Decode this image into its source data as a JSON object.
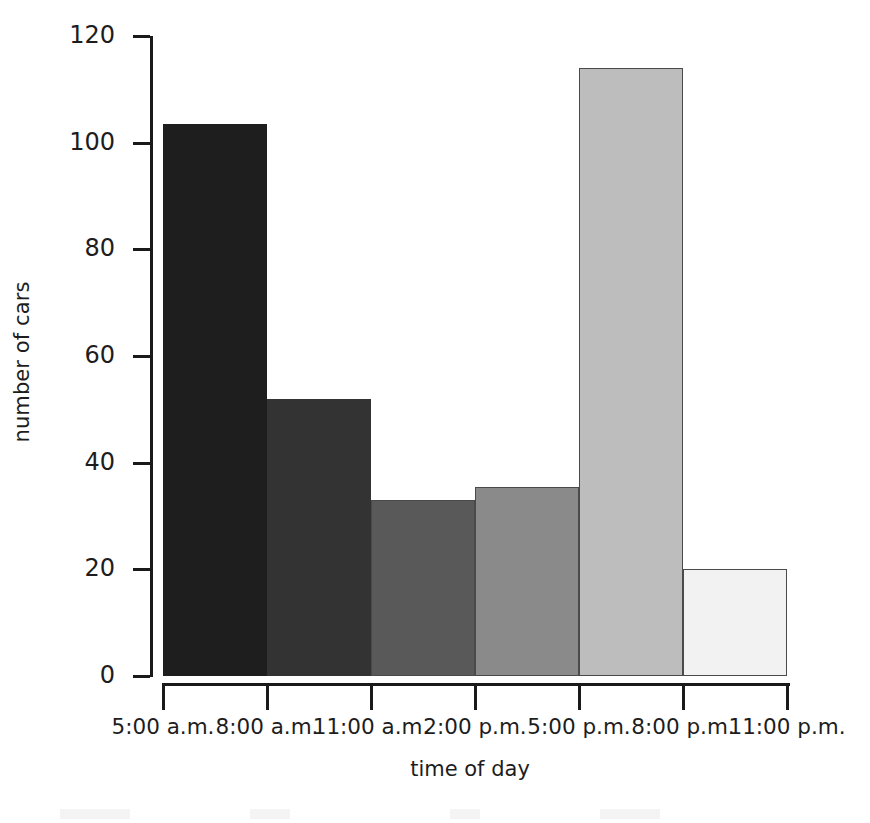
{
  "chart_data": {
    "type": "bar",
    "title": "",
    "xlabel": "time of day",
    "ylabel": "number of cars",
    "categories": [
      "5:00 a.m.",
      "8:00 a.m.",
      "11:00 a.m.",
      "2:00 p.m.",
      "5:00 p.m.",
      "8:00 p.m."
    ],
    "tick_labels": [
      "5:00 a.m.",
      "8:00 a.m.",
      "11:00 a.m.",
      "2:00 p.m.",
      "5:00 p.m.",
      "8:00 p.m.",
      "11:00 p.m."
    ],
    "values": [
      103.5,
      52,
      33,
      35.5,
      114,
      20
    ],
    "bar_colors": [
      "#1e1e1e",
      "#333333",
      "#595959",
      "#8a8a8a",
      "#bdbdbd",
      "#f2f2f2"
    ],
    "ylim": [
      0,
      120
    ],
    "yticks": [
      0,
      20,
      40,
      60,
      80,
      100,
      120
    ],
    "ytick_labels": [
      "0",
      "20",
      "40",
      "60",
      "80",
      "100",
      "120"
    ],
    "grid": false,
    "legend": null,
    "axis_color": "#1a1a1a",
    "background": "#ffffff"
  }
}
